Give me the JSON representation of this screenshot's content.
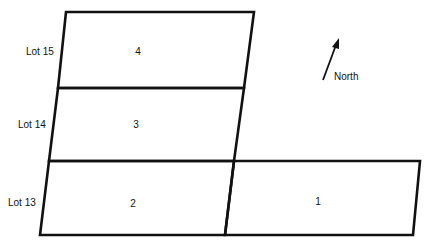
{
  "diagram": {
    "type": "lot-parcel-map",
    "row_labels": [
      "Lot 15",
      "Lot 14",
      "Lot 13"
    ],
    "parcels": [
      {
        "id": "4",
        "label": "4",
        "row": "Lot 15"
      },
      {
        "id": "3",
        "label": "3",
        "row": "Lot 14"
      },
      {
        "id": "2",
        "label": "2",
        "row": "Lot 13"
      },
      {
        "id": "1",
        "label": "1",
        "row": "Lot 13"
      }
    ],
    "compass": {
      "label": "North",
      "icon": "north-arrow-icon"
    },
    "colors": {
      "line": "#111111",
      "background": "#ffffff"
    }
  }
}
